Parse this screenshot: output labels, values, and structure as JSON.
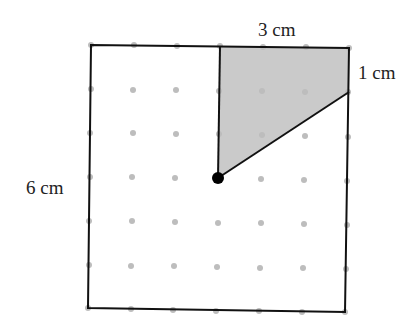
{
  "diagram": {
    "labels": {
      "top": "3 cm",
      "right": "1 cm",
      "left": "6 cm"
    },
    "square": {
      "side_cm": 6
    },
    "shaded_region": {
      "fill": "#c8c8c8",
      "description": "quadrilateral bounded by vertical line, top edge, right edge down 1 cm, and diagonal to center point"
    },
    "dot_color": "#b8b8b8",
    "line_color": "#111111",
    "center_point_color": "#000000"
  }
}
